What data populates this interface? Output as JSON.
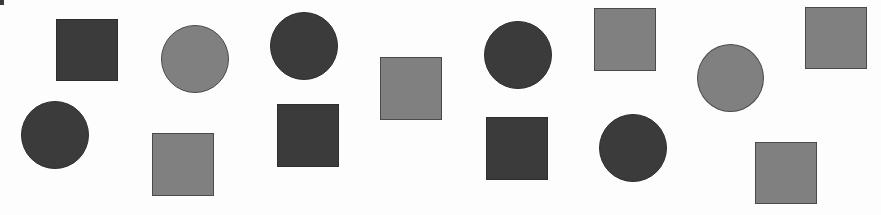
{
  "figure": {
    "width": 881,
    "height": 215,
    "background": "#fdfdfd",
    "colors": {
      "dark": "#3b3b3b",
      "light": "#808080",
      "dark_outline": "#2e2e2e",
      "light_outline": "#4a4a4a"
    },
    "counts": {
      "total": 15,
      "squares": 8,
      "circles": 7,
      "dark_squares": 3,
      "light_squares": 5,
      "dark_circles": 4,
      "light_circles": 2
    },
    "corner_mark": {
      "x": 0,
      "y": 0,
      "w": 4,
      "h": 5,
      "tone": "dark"
    },
    "shapes": [
      {
        "id": "s1",
        "type": "square",
        "tone": "dark",
        "x": 56,
        "y": 19,
        "w": 62,
        "h": 62
      },
      {
        "id": "s2",
        "type": "circle",
        "tone": "light",
        "x": 161,
        "y": 25,
        "w": 68,
        "h": 68
      },
      {
        "id": "s3",
        "type": "circle",
        "tone": "dark",
        "x": 270,
        "y": 12,
        "w": 68,
        "h": 68
      },
      {
        "id": "s4",
        "type": "square",
        "tone": "light",
        "x": 380,
        "y": 57,
        "w": 62,
        "h": 63
      },
      {
        "id": "s5",
        "type": "circle",
        "tone": "dark",
        "x": 484,
        "y": 21,
        "w": 68,
        "h": 68
      },
      {
        "id": "s6",
        "type": "square",
        "tone": "light",
        "x": 594,
        "y": 8,
        "w": 62,
        "h": 63
      },
      {
        "id": "s7",
        "type": "circle",
        "tone": "light",
        "x": 697,
        "y": 44,
        "w": 67,
        "h": 68
      },
      {
        "id": "s8",
        "type": "square",
        "tone": "light",
        "x": 805,
        "y": 7,
        "w": 62,
        "h": 62
      },
      {
        "id": "s9",
        "type": "circle",
        "tone": "dark",
        "x": 21,
        "y": 101,
        "w": 68,
        "h": 68
      },
      {
        "id": "s10",
        "type": "square",
        "tone": "light",
        "x": 152,
        "y": 133,
        "w": 62,
        "h": 63
      },
      {
        "id": "s11",
        "type": "square",
        "tone": "dark",
        "x": 277,
        "y": 104,
        "w": 62,
        "h": 63
      },
      {
        "id": "s12",
        "type": "square",
        "tone": "dark",
        "x": 486,
        "y": 117,
        "w": 62,
        "h": 63
      },
      {
        "id": "s13",
        "type": "circle",
        "tone": "dark",
        "x": 599,
        "y": 114,
        "w": 68,
        "h": 68
      },
      {
        "id": "s14",
        "type": "square",
        "tone": "light",
        "x": 755,
        "y": 142,
        "w": 62,
        "h": 62
      }
    ]
  }
}
